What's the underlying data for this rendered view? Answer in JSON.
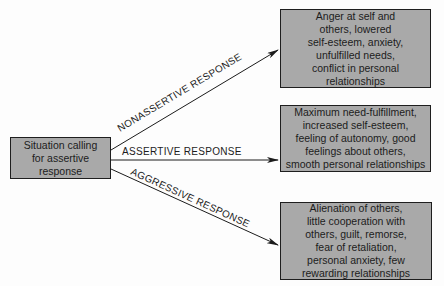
{
  "source": {
    "lines": [
      "Situation calling",
      "for assertive",
      "response"
    ]
  },
  "responses": [
    {
      "label": "NONASSERTIVE RESPONSE",
      "outcome_lines": [
        "Anger at self and",
        "others, lowered",
        "self-esteem, anxiety,",
        "unfulfilled needs,",
        "conflict in personal",
        "relationships"
      ]
    },
    {
      "label": "ASSERTIVE RESPONSE",
      "outcome_lines": [
        "Maximum need-fulfillment,",
        "increased self-esteem,",
        "feeling of autonomy, good",
        "feelings about others,",
        "smooth personal relationships"
      ]
    },
    {
      "label": "AGGRESSIVE RESPONSE",
      "outcome_lines": [
        "Alienation of others,",
        "little cooperation with",
        "others, guilt, remorse,",
        "fear of retaliation,",
        "personal anxiety, few",
        "rewarding relationships"
      ]
    }
  ],
  "colors": {
    "box_fill": "#a9a9a9",
    "border": "#1e1e1e",
    "text": "#1c1c1c"
  }
}
